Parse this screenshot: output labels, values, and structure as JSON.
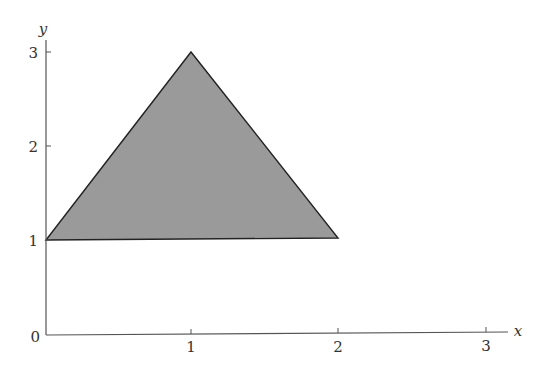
{
  "diagram": {
    "type": "coordinate-plane-triangle",
    "axes": {
      "x": {
        "label": "x",
        "ticks": [
          "1",
          "2",
          "3"
        ]
      },
      "y": {
        "label": "y",
        "ticks": [
          "1",
          "2",
          "3"
        ]
      },
      "origin_label": "0"
    },
    "triangle": {
      "vertices": [
        [
          0,
          1
        ],
        [
          1,
          3
        ],
        [
          2,
          1
        ]
      ],
      "fill_color": "#9a9a9a",
      "stroke_color": "#222222"
    }
  }
}
